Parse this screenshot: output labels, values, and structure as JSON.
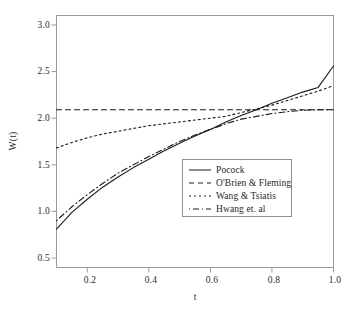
{
  "chart_data": {
    "type": "line",
    "title": "",
    "xlabel": "t",
    "ylabel": "W(t)",
    "xlim": [
      0.1,
      1.0
    ],
    "ylim": [
      0.5,
      3.0
    ],
    "xticks": [
      "0.2",
      "0.4",
      "0.6",
      "0.8",
      "1.0"
    ],
    "xtick_values": [
      0.2,
      0.4,
      0.6,
      0.8,
      1.0
    ],
    "yticks": [
      "0.5",
      "1.0",
      "1.5",
      "2.0",
      "2.5",
      "3.0"
    ],
    "ytick_values": [
      0.5,
      1.0,
      1.5,
      2.0,
      2.5,
      3.0
    ],
    "grid": false,
    "legend_position": "center-right",
    "x": [
      0.1,
      0.15,
      0.2,
      0.25,
      0.3,
      0.35,
      0.4,
      0.45,
      0.5,
      0.55,
      0.6,
      0.65,
      0.7,
      0.75,
      0.8,
      0.85,
      0.9,
      0.95,
      1.0
    ],
    "series": [
      {
        "name": "Pocock",
        "style": "solid",
        "color": "#1a1a1a",
        "values": [
          0.81,
          0.99,
          1.13,
          1.26,
          1.37,
          1.47,
          1.56,
          1.65,
          1.73,
          1.81,
          1.88,
          1.96,
          2.03,
          2.09,
          2.16,
          2.22,
          2.28,
          2.33,
          2.56
        ]
      },
      {
        "name": "O'Brien & Fleming",
        "style": "dashed",
        "color": "#1a1a1a",
        "values": [
          2.09,
          2.09,
          2.09,
          2.09,
          2.09,
          2.09,
          2.09,
          2.09,
          2.09,
          2.09,
          2.09,
          2.09,
          2.09,
          2.09,
          2.09,
          2.09,
          2.09,
          2.09,
          2.09
        ]
      },
      {
        "name": "Wang & Tsiatis",
        "style": "dotted",
        "color": "#1a1a1a",
        "values": [
          1.68,
          1.74,
          1.79,
          1.83,
          1.86,
          1.89,
          1.92,
          1.94,
          1.96,
          1.98,
          2.0,
          2.02,
          2.06,
          2.1,
          2.14,
          2.19,
          2.24,
          2.29,
          2.35
        ]
      },
      {
        "name": "Hwang et. al",
        "style": "dashdot",
        "color": "#1a1a1a",
        "values": [
          0.9,
          1.05,
          1.18,
          1.3,
          1.41,
          1.5,
          1.59,
          1.67,
          1.75,
          1.82,
          1.88,
          1.94,
          1.99,
          2.02,
          2.05,
          2.07,
          2.085,
          2.09,
          2.09
        ]
      }
    ]
  },
  "legend": {
    "items": [
      {
        "label": "Pocock"
      },
      {
        "label": "O'Brien & Fleming"
      },
      {
        "label": "Wang & Tsiatis"
      },
      {
        "label": "Hwang et. al"
      }
    ]
  }
}
